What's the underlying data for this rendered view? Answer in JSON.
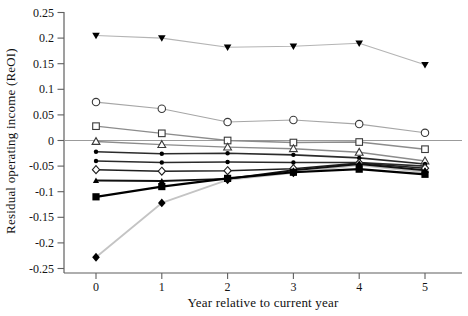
{
  "figure": {
    "y_axis_title": "Residual operating income (ReOI)",
    "x_axis_title": "Year relative to current year",
    "background_color": "#ffffff",
    "axis_color": "#5f5f5f",
    "zero_line_color": "#9b9b9b",
    "tick_label_color": "#141414"
  },
  "chart_data": {
    "type": "line",
    "title": "",
    "xlabel": "Year relative to current year",
    "ylabel": "Residual operating income (ReOI)",
    "x": [
      0,
      1,
      2,
      3,
      4,
      5
    ],
    "xtick_labels": [
      "0",
      "1",
      "2",
      "3",
      "4",
      "5"
    ],
    "ylim": [
      -0.25,
      0.25
    ],
    "yticks": [
      0.25,
      0.2,
      0.15,
      0.1,
      0.05,
      0,
      -0.05,
      -0.1,
      -0.15,
      -0.2,
      -0.25
    ],
    "ytick_labels": [
      "0.25",
      "0.2",
      "0.15",
      "0.1",
      "0.05",
      "0",
      "-0.05",
      "-0.1",
      "-0.15",
      "-0.2",
      "-0.25"
    ],
    "grid": false,
    "legend_position": "none",
    "zero_line": true,
    "series": [
      {
        "name": "series-1-filled-down-triangle",
        "marker": "triangle-down-filled",
        "marker_color": "#000000",
        "line_color": "#b4b4b4",
        "line_width": 1.1,
        "values": [
          0.205,
          0.2,
          0.182,
          0.184,
          0.19,
          0.148
        ]
      },
      {
        "name": "series-2-open-circle",
        "marker": "circle-open",
        "marker_color": "#3a3a3a",
        "line_color": "#a6a6a6",
        "line_width": 1.1,
        "values": [
          0.075,
          0.062,
          0.036,
          0.04,
          0.032,
          0.015
        ]
      },
      {
        "name": "series-3-open-square",
        "marker": "square-open",
        "marker_color": "#3a3a3a",
        "line_color": "#8c8c8c",
        "line_width": 1.4,
        "values": [
          0.028,
          0.014,
          0.0,
          -0.004,
          -0.003,
          -0.017
        ]
      },
      {
        "name": "series-4-open-triangle",
        "marker": "triangle-up-open",
        "marker_color": "#3a3a3a",
        "line_color": "#8c8c8c",
        "line_width": 1.4,
        "values": [
          -0.002,
          -0.008,
          -0.013,
          -0.016,
          -0.023,
          -0.04
        ]
      },
      {
        "name": "series-5-small-dot-a",
        "marker": "circle-filled",
        "marker_color": "#000000",
        "line_color": "#2b2b2b",
        "line_width": 1.6,
        "values": [
          -0.022,
          -0.026,
          -0.025,
          -0.028,
          -0.034,
          -0.046
        ]
      },
      {
        "name": "series-6-small-dot-b",
        "marker": "circle-filled",
        "marker_color": "#000000",
        "line_color": "#2b2b2b",
        "line_width": 1.6,
        "values": [
          -0.04,
          -0.043,
          -0.042,
          -0.043,
          -0.043,
          -0.05
        ]
      },
      {
        "name": "series-7-open-diamond",
        "marker": "diamond-open",
        "marker_color": "#1f1f1f",
        "line_color": "#1f1f1f",
        "line_width": 1.5,
        "values": [
          -0.057,
          -0.06,
          -0.059,
          -0.055,
          -0.044,
          -0.054
        ]
      },
      {
        "name": "series-8-small-filled-triangle",
        "marker": "triangle-up-filled",
        "marker_color": "#000000",
        "line_color": "#111111",
        "line_width": 1.9,
        "values": [
          -0.078,
          -0.079,
          -0.075,
          -0.058,
          -0.046,
          -0.058
        ]
      },
      {
        "name": "series-9-filled-square",
        "marker": "square-filled",
        "marker_color": "#000000",
        "line_color": "#000000",
        "line_width": 2.2,
        "values": [
          -0.11,
          -0.09,
          -0.074,
          -0.062,
          -0.056,
          -0.066
        ]
      },
      {
        "name": "series-10-filled-diamond",
        "marker": "diamond-filled",
        "marker_color": "#000000",
        "line_color": "#c4c4c4",
        "line_width": 1.8,
        "values": [
          -0.228,
          -0.122,
          -0.077,
          -0.063,
          -0.048,
          -0.062
        ]
      }
    ]
  }
}
